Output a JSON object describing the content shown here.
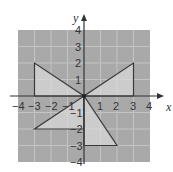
{
  "axes": {
    "x_label": "x",
    "y_label": "y",
    "x_ticks": [
      "−4",
      "−3",
      "−2",
      "−1",
      "1",
      "2",
      "3",
      "4"
    ],
    "y_ticks": [
      "4",
      "3",
      "2",
      "1",
      "−1",
      "−2",
      "−3",
      "−4"
    ],
    "range": [
      -4,
      4
    ]
  },
  "colors": {
    "grid_bg": "#a9a9a9",
    "grid_line": "#c4c4c4",
    "triangle_fill": "#d8d8d8",
    "outline": "#3a3a3a"
  },
  "shapes": {
    "triangle_upper_left": [
      [
        -3,
        2
      ],
      [
        -3,
        0
      ],
      [
        0,
        0
      ]
    ],
    "triangle_upper_right": [
      [
        3,
        2
      ],
      [
        3,
        0
      ],
      [
        0,
        0
      ]
    ],
    "triangle_lower_left": [
      [
        -3,
        -2
      ],
      [
        0,
        -2
      ],
      [
        0,
        0
      ]
    ],
    "triangle_lower_right": [
      [
        0,
        -3
      ],
      [
        2,
        -3
      ],
      [
        0,
        0
      ]
    ]
  }
}
